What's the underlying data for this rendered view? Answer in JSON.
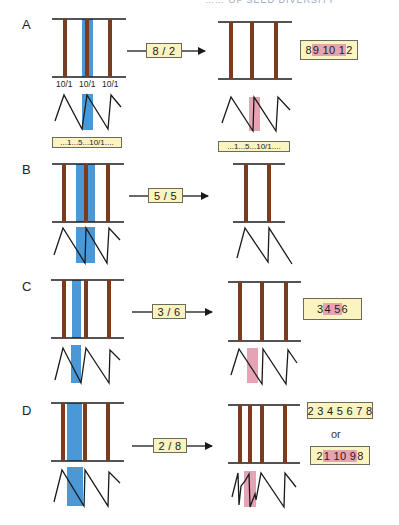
{
  "header_fragment": "…… OF SEED DIVERSITY",
  "colors": {
    "stem": "#7a3b1e",
    "line": "#1a1a1a",
    "blue_band": "#4a98d6",
    "pink_band": "#e6a3b4",
    "label_fill": "#fbf3c0",
    "label_border": "#6b6b5a"
  },
  "panels": [
    {
      "letter": "A",
      "arrow_label": "8 / 2",
      "tick_labels": [
        "10/1",
        "10/1",
        "10/1"
      ],
      "left_caption": "...1...5...10/1....",
      "right_caption": "...1...5...10/1....",
      "result": [
        {
          "parts": [
            {
              "t": "8 "
            },
            {
              "t": "9 10 1",
              "hl": true
            },
            {
              "t": " 2"
            }
          ]
        }
      ]
    },
    {
      "letter": "B",
      "arrow_label": "5 / 5",
      "result": []
    },
    {
      "letter": "C",
      "arrow_label": "3 / 6",
      "result": [
        {
          "parts": [
            {
              "t": "3 "
            },
            {
              "t": "4 5",
              "hl": true
            },
            {
              "t": " 6"
            }
          ]
        }
      ]
    },
    {
      "letter": "D",
      "arrow_label": "2 / 8",
      "or_text": "or",
      "result": [
        {
          "parts": [
            {
              "t": "2 3 4 5 6 7 8"
            }
          ]
        },
        {
          "parts": [
            {
              "t": "2 "
            },
            {
              "t": "1 10 9",
              "hl": true
            },
            {
              "t": " 8"
            }
          ]
        }
      ]
    }
  ]
}
